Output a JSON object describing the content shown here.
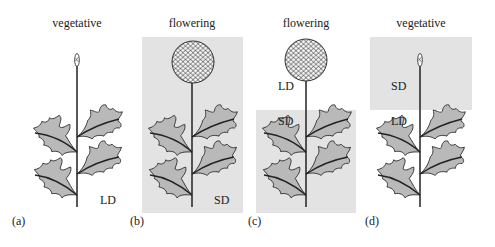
{
  "figure": {
    "colors": {
      "shade": "#e3e3e3",
      "leaf_fill": "#b9b9b9",
      "stroke": "#222222",
      "background": "#ffffff"
    },
    "panels": [
      {
        "id": "a",
        "letter": "(a)",
        "title": "vegetative",
        "state": "vegetative",
        "labels": [
          "LD"
        ]
      },
      {
        "id": "b",
        "letter": "(b)",
        "title": "flowering",
        "state": "flowering",
        "labels": [
          "SD"
        ]
      },
      {
        "id": "c",
        "letter": "(c)",
        "title": "flowering",
        "state": "flowering",
        "labels": [
          "LD",
          "SD"
        ]
      },
      {
        "id": "d",
        "letter": "(d)",
        "title": "vegetative",
        "state": "vegetative",
        "labels": [
          "SD",
          "LD"
        ]
      }
    ]
  }
}
